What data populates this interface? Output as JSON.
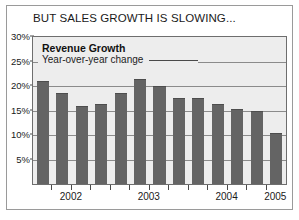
{
  "figure": {
    "title": "BUT SALES GROWTH IS SLOWING...",
    "legend": {
      "title": "Revenue Growth",
      "subtitle": "Year-over-year change"
    },
    "colors": {
      "bar": "#646464",
      "plot_background": "#ededed",
      "gridline": "#8b8b8b",
      "frame": "#9a9a9a",
      "text": "#1a1a1a"
    }
  },
  "chart_data": {
    "type": "bar",
    "title": "BUT SALES GROWTH IS SLOWING...",
    "xlabel": "",
    "ylabel": "Year-over-year change",
    "ylim": [
      0,
      30
    ],
    "ytick_values": [
      5,
      10,
      15,
      20,
      25,
      30
    ],
    "ytick_labels": [
      "5%",
      "10%",
      "15%",
      "20%",
      "25%",
      "30%"
    ],
    "grid": true,
    "legend_position": "inside-top-left",
    "categories": [
      "2002 Q1",
      "2002 Q2",
      "2002 Q3",
      "2002 Q4",
      "2003 Q1",
      "2003 Q2",
      "2003 Q3",
      "2003 Q4",
      "2004 Q1",
      "2004 Q2",
      "2004 Q3",
      "2004 Q4",
      "2005 Q1"
    ],
    "values": [
      21,
      18.5,
      16,
      16.3,
      18.5,
      21.5,
      20,
      17.5,
      17.5,
      16.3,
      15.3,
      14.8,
      10.5
    ],
    "xtick_labels": [
      "2002",
      "2003",
      "2004",
      "2005"
    ],
    "xtick_group_starts": [
      0,
      4,
      8,
      12
    ],
    "series": [
      {
        "name": "Revenue Growth",
        "values": [
          21,
          18.5,
          16,
          16.3,
          18.5,
          21.5,
          20,
          17.5,
          17.5,
          16.3,
          15.3,
          14.8,
          10.5
        ]
      }
    ]
  }
}
